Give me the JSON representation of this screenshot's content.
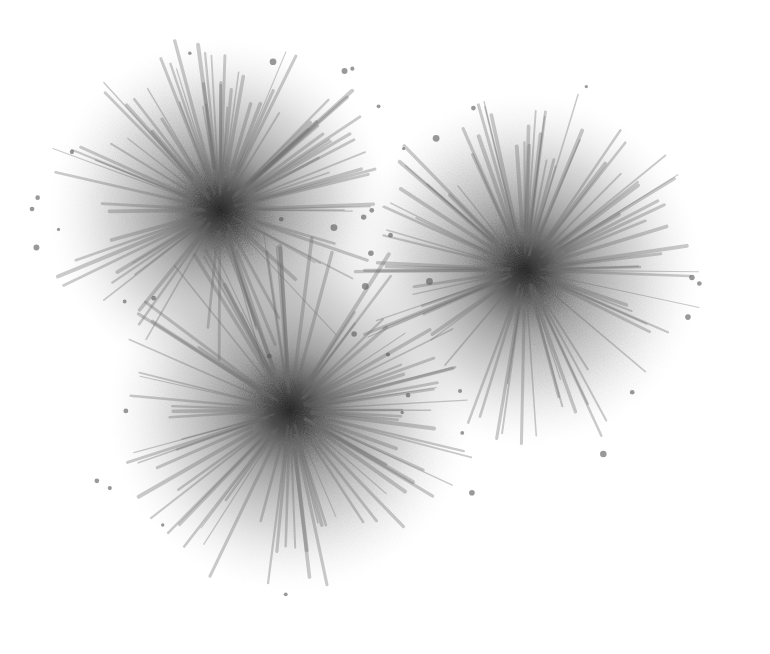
{
  "artwork": {
    "description": "Three grayscale ink-wash flower bursts on white paper",
    "background": "#ffffff",
    "ink_dark": "#2a2a2a",
    "ink_mid": "#7a7a7a",
    "ink_light": "#c8c8c8",
    "blooms": [
      {
        "name": "upper-left-bloom",
        "cx": 220,
        "cy": 210,
        "r": 170
      },
      {
        "name": "right-bloom",
        "cx": 525,
        "cy": 270,
        "r": 175
      },
      {
        "name": "bottom-bloom",
        "cx": 290,
        "cy": 410,
        "r": 180
      }
    ]
  }
}
